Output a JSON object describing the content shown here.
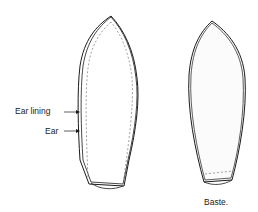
{
  "diagram": {
    "labels": {
      "ear_lining": "Ear lining",
      "ear": "Ear",
      "baste": "Baste."
    },
    "colors": {
      "outline": "#1a1a1a",
      "stitch": "#777777",
      "fill": "#fdfdfd"
    }
  }
}
